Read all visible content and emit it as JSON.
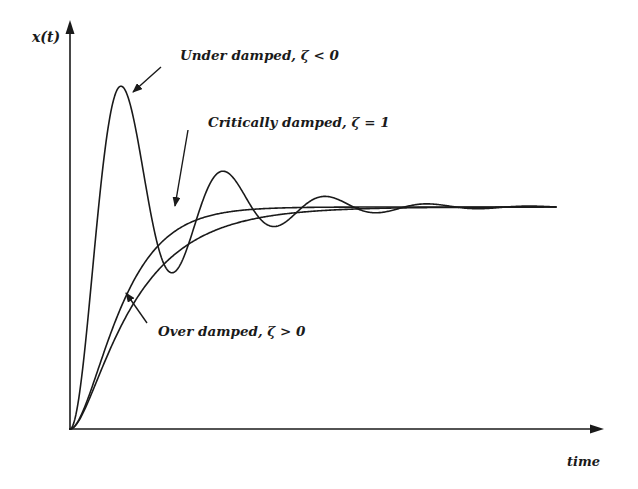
{
  "chart_data": {
    "type": "line",
    "title": "",
    "xlabel": "time",
    "ylabel": "x(t)",
    "xlim": [
      0,
      10
    ],
    "ylim": [
      0,
      1.9
    ],
    "grid": false,
    "legend": "none (inline annotations with arrows)",
    "steady_state": 1.0,
    "series": [
      {
        "name": "Under damped, ζ < 0",
        "kind": "underdamped",
        "points_x": [
          0,
          1.05,
          2.15,
          3.2,
          4.35,
          5.4,
          6.55,
          7.7,
          8.8,
          10
        ],
        "points_y": [
          0,
          1.54,
          0.73,
          1.15,
          0.93,
          1.04,
          0.97,
          1.01,
          0.995,
          1.0
        ],
        "description": "Step response with large overshoot (~54%) and decaying oscillation"
      },
      {
        "name": "Critically damped, ζ = 1",
        "kind": "critical",
        "points_x": [
          0,
          0.5,
          1,
          1.5,
          2,
          3,
          4,
          6,
          10
        ],
        "points_y": [
          0,
          0.55,
          0.83,
          0.93,
          0.97,
          0.995,
          1.0,
          1.0,
          1.0
        ],
        "description": "Fastest rise to steady state without overshoot"
      },
      {
        "name": "Over damped, ζ > 0",
        "kind": "overdamped",
        "points_x": [
          0,
          0.5,
          1,
          2,
          3,
          4,
          5,
          6,
          8,
          10
        ],
        "points_y": [
          0,
          0.33,
          0.55,
          0.78,
          0.89,
          0.95,
          0.975,
          0.99,
          0.998,
          1.0
        ],
        "description": "Slow rise to steady state without overshoot"
      }
    ],
    "annotations": [
      {
        "text": "Under damped, ζ < 0",
        "target": "first peak of under damped curve"
      },
      {
        "text": "Critically damped, ζ = 1",
        "target": "critically damped curve near steady state"
      },
      {
        "text": "Over damped, ζ > 0",
        "target": "over damped curve during rise"
      }
    ]
  },
  "labels": {
    "y_axis": "x(t)",
    "x_axis": "time",
    "under": "Under damped, ζ < 0",
    "critical": "Critically damped, ζ = 1",
    "over": "Over damped, ζ > 0"
  },
  "colors": {
    "ink": "#1a1a1a",
    "background": "#ffffff"
  }
}
